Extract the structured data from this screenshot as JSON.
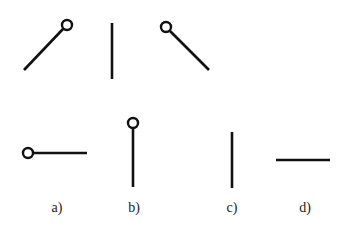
{
  "diagram": {
    "colors": {
      "stroke": "#111111",
      "background": "#ffffff",
      "label": "#222222"
    },
    "top_row": [
      {
        "name": "diagonal-up-right-with-circle",
        "line": [
          24,
          70,
          63,
          30
        ],
        "circle": [
          67,
          25,
          5
        ]
      },
      {
        "name": "vertical-plain",
        "line": [
          112,
          23,
          112,
          79
        ]
      },
      {
        "name": "diagonal-down-right-with-circle",
        "line": [
          170,
          32,
          209,
          70
        ],
        "circle": [
          166,
          27,
          5
        ]
      }
    ],
    "bottom_row": [
      {
        "label": "a)",
        "label_pos": [
          57,
          208
        ],
        "line": [
          33,
          153,
          87,
          153
        ],
        "circle": [
          28,
          153,
          5
        ]
      },
      {
        "label": "b)",
        "label_pos": [
          134,
          208
        ],
        "line": [
          133,
          128,
          133,
          187
        ],
        "circle": [
          133,
          123,
          5
        ]
      },
      {
        "label": "c)",
        "label_pos": [
          232,
          208
        ],
        "line": [
          232,
          132,
          232,
          188
        ]
      },
      {
        "label": "d)",
        "label_pos": [
          305,
          208
        ],
        "line": [
          276,
          160,
          330,
          160
        ]
      }
    ]
  },
  "labels": {
    "a": "a)",
    "b": "b)",
    "c": "c)",
    "d": "d)"
  }
}
